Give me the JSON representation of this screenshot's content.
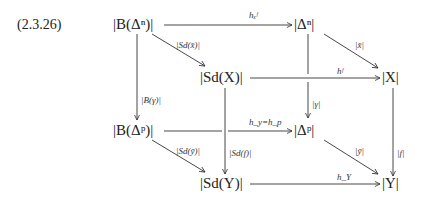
{
  "equation_number": "(2.3.26)",
  "nodes": {
    "BDn": "|B(Δⁿ)|",
    "Dn": "|Δⁿ|",
    "SdX": "|Sd(X)|",
    "X": "|X|",
    "BDp": "|B(Δᵖ)|",
    "Dp": "|Δᵖ|",
    "SdY": "|Sd(Y)|",
    "Y": "|Y|"
  },
  "arrows": {
    "hxf": "hₓᶠ",
    "Sdx": "|Sd(x̄)|",
    "x": "|x̄|",
    "hf": "hᶠ",
    "Bgamma": "|B(γ)|",
    "gamma": "|γ|",
    "hy_hp": "h_y=h_p",
    "Sdy": "|Sd(ȳ)|",
    "Sdf": "|Sd(f)|",
    "y": "|ȳ|",
    "f": "|f|",
    "hY": "h_Y"
  }
}
